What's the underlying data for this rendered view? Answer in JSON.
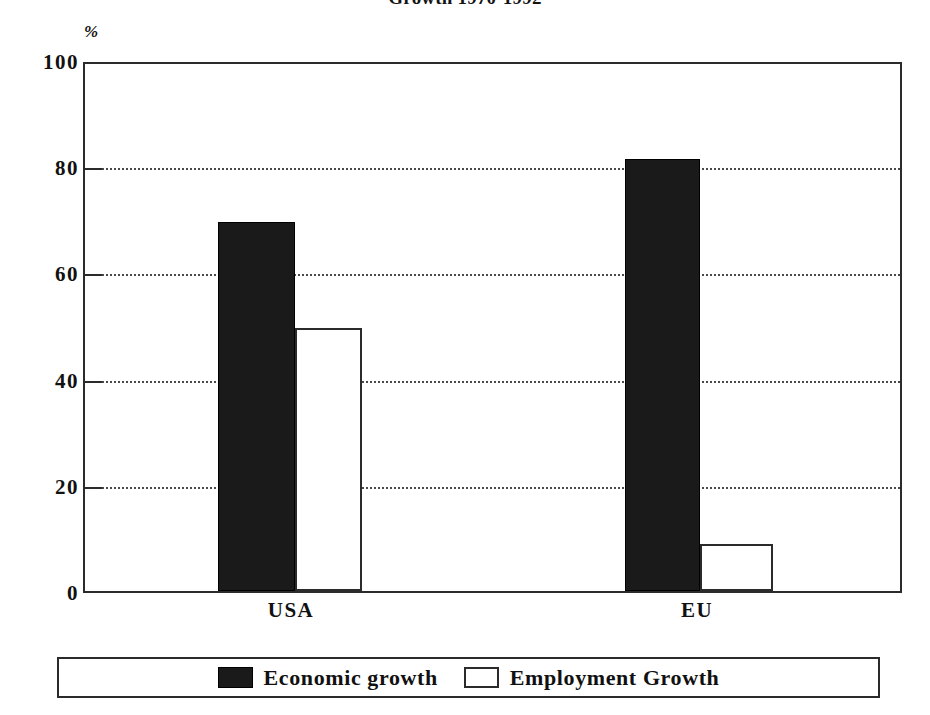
{
  "chart_data": {
    "type": "bar",
    "title": "Growth 1970-1992",
    "xlabel": "",
    "ylabel": "%",
    "ylim": [
      0,
      100
    ],
    "yticks": [
      0,
      20,
      40,
      60,
      80,
      100
    ],
    "ytick_labels": [
      "0",
      "20",
      "40",
      "60",
      "80",
      "100"
    ],
    "grid": true,
    "gridlines_at": [
      20,
      40,
      60,
      80
    ],
    "legend_position": "bottom",
    "categories": [
      "USA",
      "EU"
    ],
    "series": [
      {
        "name": "Economic growth",
        "style": "filled",
        "color": "#1a1a1a",
        "values": [
          70,
          82
        ]
      },
      {
        "name": "Employment Growth",
        "style": "outline",
        "color": "#ffffff",
        "values": [
          50,
          9
        ]
      }
    ]
  },
  "axis": {
    "unit_label": "%",
    "tick_labels": [
      "100",
      "80",
      "60",
      "40",
      "20",
      "0"
    ],
    "category_labels": [
      "USA",
      "EU"
    ]
  },
  "legend": {
    "entries": [
      {
        "label": "Economic growth",
        "swatch": "filled-square-icon"
      },
      {
        "label": "Employment Growth",
        "swatch": "outline-square-icon"
      }
    ]
  },
  "colors": {
    "bar_filled": "#1a1a1a",
    "bar_outline_stroke": "#2b2b2b",
    "axis": "#2b2b2b",
    "grid": "#4a4a4a",
    "text": "#111111",
    "background": "#ffffff"
  }
}
